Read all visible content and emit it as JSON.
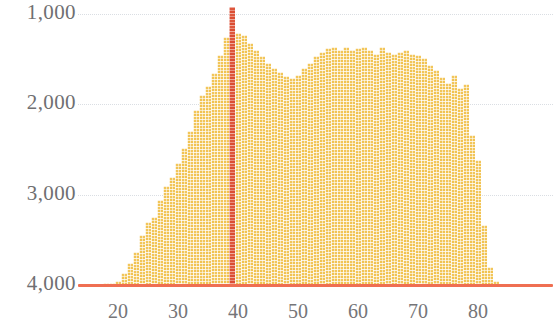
{
  "chart_data": {
    "type": "bar",
    "title": "",
    "subtitle": "",
    "xlabel": "",
    "ylabel": "",
    "grid": true,
    "legend": null,
    "y_axis_inverted": true,
    "xlim": [
      16,
      85
    ],
    "ylim": [
      4000,
      800
    ],
    "y_ticks": [
      1000,
      2000,
      3000,
      4000
    ],
    "y_tick_labels": [
      "1,000",
      "2,000",
      "3,000",
      "4,000"
    ],
    "x_ticks": [
      20,
      30,
      40,
      50,
      60,
      70,
      80
    ],
    "x_tick_labels": [
      "20",
      "30",
      "40",
      "50",
      "60",
      "70",
      "80"
    ],
    "baseline_value": 4000,
    "highlight_x": 39,
    "colors": {
      "bar": "#f0c04a",
      "bar_light": "#f7e3ac",
      "highlight": "#d9452a",
      "baseline": "#ef6f52",
      "gridline": "#d9dde2",
      "axis_text": "#6f6f72",
      "background": "#ffffff"
    },
    "categories": [
      18,
      19,
      20,
      21,
      22,
      23,
      24,
      25,
      26,
      27,
      28,
      29,
      30,
      31,
      32,
      33,
      34,
      35,
      36,
      37,
      38,
      39,
      40,
      41,
      42,
      43,
      44,
      45,
      46,
      47,
      48,
      49,
      50,
      51,
      52,
      53,
      54,
      55,
      56,
      57,
      58,
      59,
      60,
      61,
      62,
      63,
      64,
      65,
      66,
      67,
      68,
      69,
      70,
      71,
      72,
      73,
      74,
      75,
      76,
      77,
      78,
      79,
      80,
      81,
      82,
      83
    ],
    "values": [
      3980,
      3975,
      3960,
      3870,
      3760,
      3640,
      3450,
      3300,
      3250,
      3060,
      2900,
      2800,
      2650,
      2480,
      2300,
      2060,
      1900,
      1800,
      1650,
      1450,
      1250,
      920,
      1210,
      1230,
      1320,
      1400,
      1470,
      1540,
      1600,
      1640,
      1690,
      1710,
      1680,
      1600,
      1540,
      1470,
      1420,
      1380,
      1370,
      1400,
      1360,
      1400,
      1380,
      1370,
      1400,
      1440,
      1370,
      1420,
      1440,
      1420,
      1400,
      1440,
      1450,
      1490,
      1560,
      1620,
      1700,
      1760,
      1680,
      1820,
      1770,
      2340,
      2620,
      3340,
      3800,
      3960
    ]
  }
}
